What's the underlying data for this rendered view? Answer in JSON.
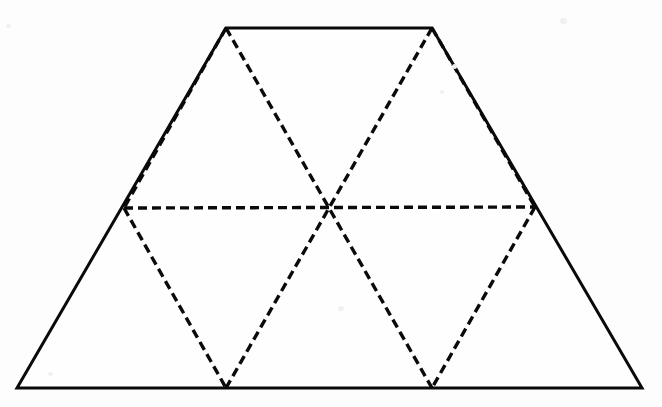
{
  "figure": {
    "title": "Trapezoid with inscribed hexagon divided into six triangles",
    "canvas": {
      "width": 662,
      "height": 407
    },
    "background_color": "#fdfdfd",
    "stroke_color": "#0a0a0a",
    "solid_stroke_width": 3,
    "dashed_stroke_width": 3.4,
    "dash_pattern": "9 5",
    "points": {
      "trapezoid_top_left": {
        "x": 226,
        "y": 28,
        "label": "A"
      },
      "trapezoid_top_right": {
        "x": 432,
        "y": 28,
        "label": "B"
      },
      "trapezoid_bottom_right": {
        "x": 642,
        "y": 388,
        "label": "C"
      },
      "trapezoid_bottom_left": {
        "x": 17,
        "y": 388,
        "label": "D"
      },
      "hexagon_left": {
        "x": 124,
        "y": 208,
        "label": "E"
      },
      "hexagon_right": {
        "x": 535,
        "y": 207,
        "label": "F"
      },
      "hexagon_bottom_left": {
        "x": 226,
        "y": 388,
        "label": "G"
      },
      "hexagon_bottom_right": {
        "x": 432,
        "y": 388,
        "label": "H"
      },
      "center": {
        "x": 327,
        "y": 206,
        "label": "O"
      }
    },
    "solid_outline_path": "M 226 28 L 432 28 L 642 388 L 17 388 Z",
    "dashed_segments": [
      {
        "name": "hexagon-side-top-left",
        "d": "M 226 28 L 124 208"
      },
      {
        "name": "hexagon-side-top-right",
        "d": "M 432 28 L 535 207"
      },
      {
        "name": "hexagon-side-bottom-left",
        "d": "M 124 208 L 226 388"
      },
      {
        "name": "hexagon-side-bottom-right",
        "d": "M 535 207 L 432 388"
      },
      {
        "name": "hexagon-horizontal-diagonal",
        "d": "M 124 208 L 535 207"
      },
      {
        "name": "diagonal-top-left-to-bottom-right",
        "d": "M 226 28 L 432 388"
      },
      {
        "name": "diagonal-top-right-to-bottom-left",
        "d": "M 432 28 L 226 388"
      }
    ],
    "counts": {
      "triangles": 6,
      "hexagon_sides": 6,
      "solid_edges": 4
    }
  }
}
